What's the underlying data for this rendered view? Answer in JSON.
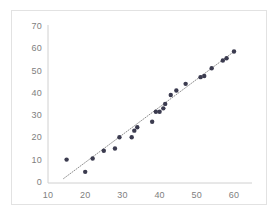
{
  "chart_data": {
    "type": "scatter",
    "title": "",
    "subtitle": "",
    "xlabel": "",
    "ylabel": "",
    "xlim": [
      10,
      62
    ],
    "ylim": [
      0,
      70
    ],
    "xticks": [
      10,
      20,
      30,
      40,
      50,
      60
    ],
    "yticks": [
      0,
      10,
      20,
      30,
      40,
      50,
      60,
      70
    ],
    "grid": false,
    "legend": false,
    "legend_position": "none",
    "marker_color": "#3b3b4f",
    "marker_size": 3,
    "trendline": {
      "type": "linear-dotted",
      "color": "#8e8e8e",
      "style": "dotted",
      "x_start": 14.2,
      "y_start": 2.0,
      "x_end": 60.5,
      "y_end": 59.6
    },
    "series": [
      {
        "name": "Series 1",
        "points": [
          [
            15.0,
            10.5
          ],
          [
            20.0,
            5.0
          ],
          [
            22.0,
            11.0
          ],
          [
            25.0,
            14.5
          ],
          [
            28.0,
            15.5
          ],
          [
            29.2,
            20.5
          ],
          [
            32.5,
            20.5
          ],
          [
            33.2,
            23.5
          ],
          [
            34.0,
            25.0
          ],
          [
            38.0,
            27.5
          ],
          [
            39.0,
            32.0
          ],
          [
            40.0,
            32.0
          ],
          [
            41.0,
            33.5
          ],
          [
            41.5,
            35.5
          ],
          [
            43.0,
            39.5
          ],
          [
            44.5,
            41.5
          ],
          [
            47.0,
            44.5
          ],
          [
            51.0,
            47.5
          ],
          [
            52.0,
            48.0
          ],
          [
            54.0,
            51.5
          ],
          [
            57.0,
            55.0
          ],
          [
            58.0,
            56.0
          ],
          [
            60.0,
            59.0
          ]
        ]
      }
    ]
  },
  "axes": {
    "y_labels": [
      "70",
      "60",
      "50",
      "40",
      "30",
      "20",
      "10",
      "0"
    ],
    "x_labels": [
      "10",
      "20",
      "30",
      "40",
      "50",
      "60"
    ],
    "axis_color": "#d0d0d0",
    "label_color": "#808080"
  }
}
